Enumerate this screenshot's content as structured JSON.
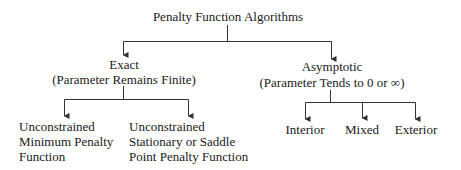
{
  "diagram": {
    "root": {
      "label": "Penalty Function Algorithms"
    },
    "branches": [
      {
        "title": "Exact",
        "subtitle": "(Parameter Remains Finite)",
        "children": [
          {
            "lines": [
              "Unconstrained",
              "Minimum Penalty",
              "Function"
            ]
          },
          {
            "lines": [
              "Unconstrained",
              "Stationary or Saddle",
              "Point Penalty Function"
            ]
          }
        ]
      },
      {
        "title": "Asymptotic",
        "subtitle": "(Parameter Tends to 0 or ∞)",
        "children": [
          {
            "lines": [
              "Interior"
            ]
          },
          {
            "lines": [
              "Mixed"
            ]
          },
          {
            "lines": [
              "Exterior"
            ]
          }
        ]
      }
    ],
    "line_color": "#333333"
  }
}
